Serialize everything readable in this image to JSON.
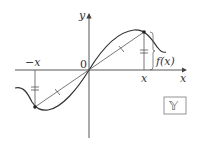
{
  "diagram": {
    "axes": {
      "x_label": "x",
      "y_label": "y",
      "origin_label": "0"
    },
    "points": {
      "positive_x_label": "x",
      "negative_x_label": "−x",
      "function_value_label": "f(x)"
    },
    "badge": {
      "label": "𝕐"
    },
    "colors": {
      "curve": "#333333",
      "axis": "#444444",
      "secant": "#555555",
      "badge_border": "#888888"
    }
  }
}
